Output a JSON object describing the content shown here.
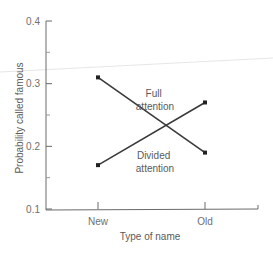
{
  "chart_data": {
    "type": "line",
    "title": "",
    "xlabel": "Type of name",
    "ylabel": "Probability called famous",
    "categories": [
      "New",
      "Old"
    ],
    "ylim": [
      0.1,
      0.4
    ],
    "yticks": [
      "0.1",
      "0.2",
      "0.3",
      "0.4"
    ],
    "grid": false,
    "legend_position": "inline labels",
    "series": [
      {
        "name": "Full attention",
        "label_lines": [
          "Full",
          "attention"
        ],
        "values": [
          0.31,
          0.19
        ]
      },
      {
        "name": "Divided attention",
        "label_lines": [
          "Divided",
          "attention"
        ],
        "values": [
          0.17,
          0.27
        ]
      }
    ]
  },
  "colors": {
    "axis": "#6a6a6a",
    "line": "#3a3a3a",
    "text": "#5a5a5a"
  }
}
